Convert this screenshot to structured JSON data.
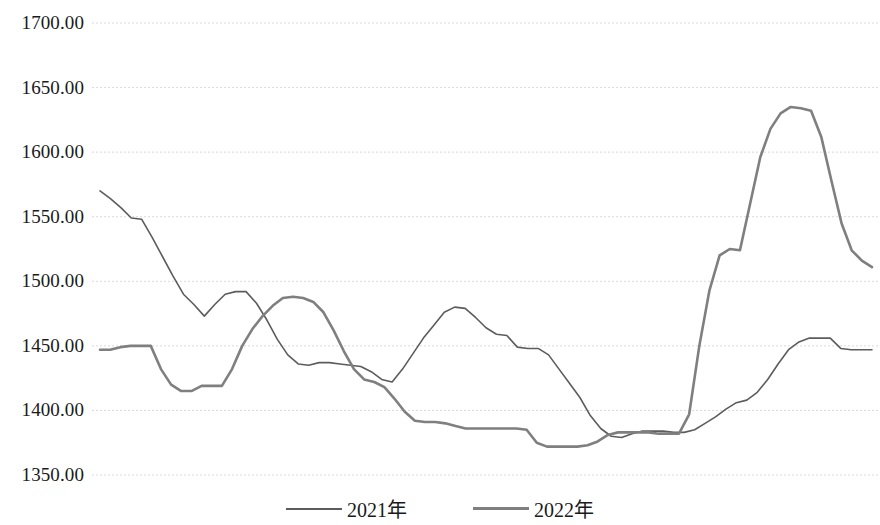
{
  "chart_data": {
    "type": "line",
    "title": "",
    "subtitle": "",
    "xlabel": "",
    "ylabel": "",
    "ylim": [
      1350,
      1700
    ],
    "y_ticks": [
      1350,
      1400,
      1450,
      1500,
      1550,
      1600,
      1650,
      1700
    ],
    "y_tick_labels": [
      "1350.00",
      "1400.00",
      "1450.00",
      "1500.00",
      "1550.00",
      "1600.00",
      "1650.00",
      "1700.00"
    ],
    "x_tick_labels": [],
    "grid": true,
    "grid_style": "dotted-horizontal",
    "grid_color": "#d9d9d9",
    "legend_position": "bottom-center",
    "background_color": "#ffffff",
    "series": [
      {
        "name": "2021年",
        "color": "#5c5c5c",
        "line_width": 1.6,
        "values": [
          1570,
          1564,
          1557,
          1549,
          1548,
          1534,
          1519,
          1504,
          1490,
          1482,
          1473,
          1482,
          1490,
          1492,
          1492,
          1483,
          1470,
          1455,
          1443,
          1436,
          1435,
          1437,
          1437,
          1436,
          1435,
          1434,
          1430,
          1424,
          1422,
          1432,
          1444,
          1456,
          1466,
          1476,
          1480,
          1479,
          1472,
          1464,
          1459,
          1458,
          1449,
          1448,
          1448,
          1443,
          1432,
          1421,
          1410,
          1396,
          1386,
          1380,
          1379,
          1382,
          1384,
          1384,
          1384,
          1383,
          1383,
          1385,
          1390,
          1395,
          1401,
          1406,
          1408,
          1414,
          1424,
          1436,
          1447,
          1453,
          1456,
          1456,
          1456,
          1448,
          1447,
          1447,
          1447
        ]
      },
      {
        "name": "2022年",
        "color": "#7f7f7f",
        "line_width": 2.6,
        "values": [
          1447,
          1447,
          1449,
          1450,
          1450,
          1450,
          1432,
          1420,
          1415,
          1415,
          1419,
          1419,
          1419,
          1432,
          1450,
          1463,
          1473,
          1481,
          1487,
          1488,
          1487,
          1484,
          1476,
          1462,
          1446,
          1432,
          1424,
          1422,
          1418,
          1409,
          1399,
          1392,
          1391,
          1391,
          1390,
          1388,
          1386,
          1386,
          1386,
          1386,
          1386,
          1386,
          1385,
          1375,
          1372,
          1372,
          1372,
          1372,
          1373,
          1376,
          1381,
          1383,
          1383,
          1383,
          1383,
          1382,
          1382,
          1382,
          1397,
          1450,
          1493,
          1520,
          1525,
          1524,
          1560,
          1596,
          1618,
          1630,
          1635,
          1634,
          1632,
          1612,
          1578,
          1545,
          1524,
          1516,
          1511
        ]
      }
    ]
  },
  "legend": {
    "items": [
      {
        "label": "2021年",
        "series_key": "2021"
      },
      {
        "label": "2022年",
        "series_key": "2022"
      }
    ]
  }
}
